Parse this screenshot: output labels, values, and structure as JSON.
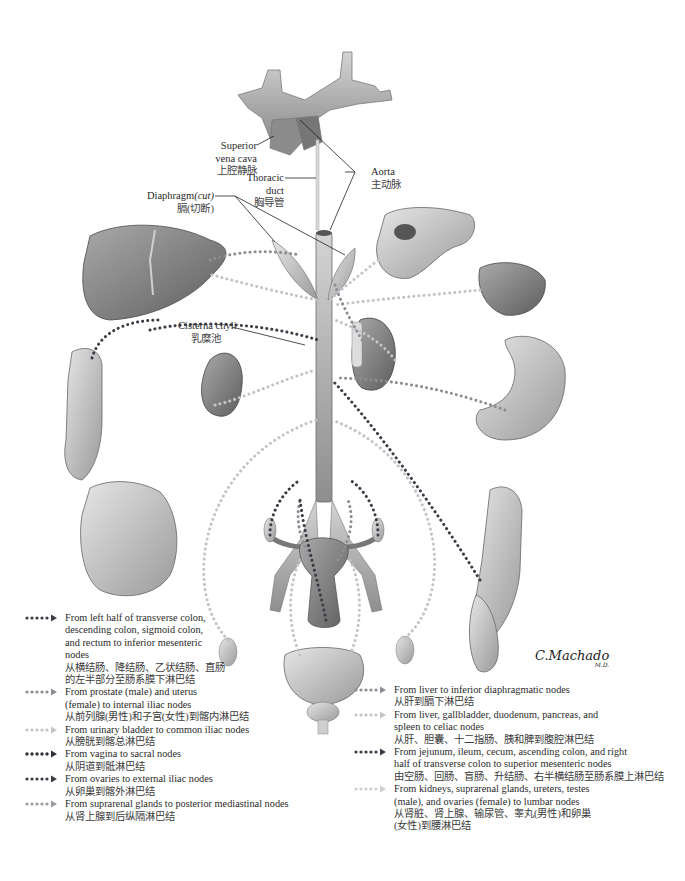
{
  "diagram": {
    "type": "anatomical illustration"
  },
  "colors": {
    "background": "#ffffff",
    "organ_fill": "#8a8a8a",
    "organ_light": "#c8c8c8",
    "leader_line": "#222222",
    "dark_dots": "#3c3c46",
    "medium_dots": "#8d8d95",
    "light_dots": "#c4c4c8"
  },
  "labels": {
    "svc_en_1": "Superior",
    "svc_en_2": "vena cava",
    "svc_zh": "上腔静脉",
    "thoracic_en_1": "Thoracic",
    "thoracic_en_2": "duct",
    "thoracic_zh": "胸导管",
    "aorta_en": "Aorta",
    "aorta_zh": "主动脉",
    "diaphragm_en": "Diaphragm",
    "diaphragm_cut": "(cut)",
    "diaphragm_zh": "膈(切断)",
    "cisterna_en": "Cisterna chyli",
    "cisterna_zh": "乳糜池"
  },
  "legend_left": [
    {
      "style": "dark",
      "en": "From left half of transverse colon,\ndescending colon, sigmoid colon,\nand rectum to inferior mesenteric\nnodes",
      "zh": "从横结肠、降结肠、乙状结肠、直肠\n的左半部分至肠系膜下淋巴结"
    },
    {
      "style": "medium",
      "en": "From prostate (male) and uterus\n(female) to internal iliac nodes",
      "zh": "从前列腺(男性)和子宫(女性)到髂内淋巴结"
    },
    {
      "style": "light",
      "en": "From urinary bladder to common iliac nodes",
      "zh": "从膀胱到髂总淋巴结"
    },
    {
      "style": "dark",
      "en": "From vagina to sacral nodes",
      "zh": "从阴道到骶淋巴结"
    },
    {
      "style": "dark",
      "en": "From ovaries to external iliac nodes",
      "zh": "从卵巢到髂外淋巴结"
    },
    {
      "style": "medium",
      "en": "From suprarenal glands to posterior mediastinal nodes",
      "zh": "从肾上腺到后纵隔淋巴结"
    }
  ],
  "legend_right": [
    {
      "style": "medium",
      "en": "From liver to inferior diaphragmatic nodes",
      "zh": "从肝到膈下淋巴结"
    },
    {
      "style": "light",
      "en": "From liver, gallbladder, duodenum, pancreas, and\nspleen to celiac nodes",
      "zh": "从肝、胆囊、十二指肠、胰和脾到腹腔淋巴结"
    },
    {
      "style": "dark",
      "en": "From jejunum, ileum, cecum, ascending colon, and right\nhalf of transverse colon to superior mesenteric nodes",
      "zh": "由空肠、回肠、盲肠、升结肠、右半横结肠至肠系膜上淋巴结"
    },
    {
      "style": "light",
      "en": "From kidneys, suprarenal glands, ureters, testes\n(male), and ovaries (female) to lumbar nodes",
      "zh": "从肾脏、肾上腺、输尿管、睾丸(男性)和卵巢\n(女性)到腰淋巴结"
    }
  ],
  "signature": {
    "name": "C.Machado",
    "suffix": "M.D."
  }
}
